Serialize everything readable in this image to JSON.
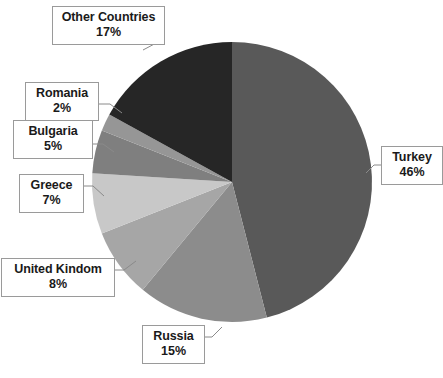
{
  "chart_data": {
    "type": "pie",
    "title": "",
    "subtitle": "",
    "xlabel": "",
    "ylabel": "",
    "legend_position": "none",
    "grid": false,
    "units": "percent",
    "start_angle_deg": 0,
    "direction": "clockwise",
    "categories": [
      "Turkey",
      "Russia",
      "United Kindom",
      "Greece",
      "Bulgaria",
      "Romania",
      "Other Countries"
    ],
    "values": [
      46,
      15,
      8,
      7,
      5,
      2,
      17
    ],
    "value_suffix": "%",
    "slices": [
      {
        "label": "Turkey",
        "value": 46,
        "value_text": "46%",
        "color": "#595959"
      },
      {
        "label": "Russia",
        "value": 15,
        "value_text": "15%",
        "color": "#8c8c8c"
      },
      {
        "label": "United Kindom",
        "value": 8,
        "value_text": "8%",
        "color": "#a6a6a6"
      },
      {
        "label": "Greece",
        "value": 7,
        "value_text": "7%",
        "color": "#c8c8c8"
      },
      {
        "label": "Bulgaria",
        "value": 5,
        "value_text": "5%",
        "color": "#7f7f7f"
      },
      {
        "label": "Romania",
        "value": 2,
        "value_text": "2%",
        "color": "#969696"
      },
      {
        "label": "Other Countries",
        "value": 17,
        "value_text": "17%",
        "color": "#262626"
      }
    ]
  },
  "callouts": {
    "other": {
      "label": "Other Countries",
      "value_text": "17%"
    },
    "romania": {
      "label": "Romania",
      "value_text": "2%"
    },
    "bulgaria": {
      "label": "Bulgaria",
      "value_text": "5%"
    },
    "greece": {
      "label": "Greece",
      "value_text": "7%"
    },
    "uk": {
      "label": "United Kindom",
      "value_text": "8%"
    },
    "russia": {
      "label": "Russia",
      "value_text": "15%"
    },
    "turkey": {
      "label": "Turkey",
      "value_text": "46%"
    }
  },
  "colors": {
    "background": "#ffffff",
    "callout_border": "#9a9a9a",
    "callout_fill": "#ffffff",
    "text": "#1a1a1a",
    "leader_line": "#8a8a8a"
  }
}
